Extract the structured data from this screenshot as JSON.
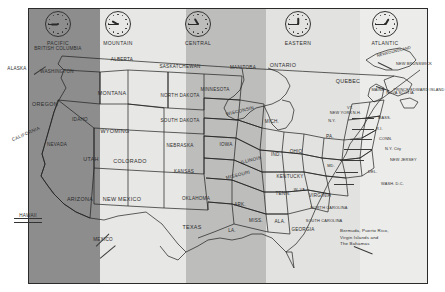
{
  "map": {
    "title": "North American Time Zones",
    "zones": [
      {
        "name": "PACIFIC",
        "clock_time": "9:00",
        "hour_deg": 270,
        "minute_deg": 270,
        "shade": "#8d8d8d"
      },
      {
        "name": "MOUNTAIN",
        "clock_time": "10:00",
        "hour_deg": 300,
        "minute_deg": 270,
        "shade": "#e7e7e5"
      },
      {
        "name": "CENTRAL",
        "clock_time": "11:00",
        "hour_deg": 330,
        "minute_deg": 270,
        "shade": "#bdbdbc"
      },
      {
        "name": "EASTERN",
        "clock_time": "12:00",
        "hour_deg": 0,
        "minute_deg": 270,
        "shade": "#e2e2e0"
      },
      {
        "name": "ATLANTIC",
        "clock_time": "1:00",
        "hour_deg": 30,
        "minute_deg": 270,
        "shade": "#ececea"
      }
    ],
    "canada": [
      {
        "label": "BRITISH COLUMBIA"
      },
      {
        "label": "ALBERTA"
      },
      {
        "label": "SASKATCHEWAN"
      },
      {
        "label": "MANITOBA"
      },
      {
        "label": "ONTARIO"
      },
      {
        "label": "QUEBEC"
      },
      {
        "label": "NEWFOUNDLAND"
      },
      {
        "label": "NEW BRUNSWICK"
      },
      {
        "label": "NOVA SCOTIA"
      },
      {
        "label": "PRINCE EDWARD ISLAND"
      }
    ],
    "states": [
      {
        "label": "WASHINGTON"
      },
      {
        "label": "OREGON"
      },
      {
        "label": "CALIFORNIA"
      },
      {
        "label": "NEVADA"
      },
      {
        "label": "IDAHO"
      },
      {
        "label": "MONTANA"
      },
      {
        "label": "WYOMING"
      },
      {
        "label": "UTAH"
      },
      {
        "label": "COLORADO"
      },
      {
        "label": "ARIZONA"
      },
      {
        "label": "NEW MEXICO"
      },
      {
        "label": "NORTH DAKOTA"
      },
      {
        "label": "SOUTH DAKOTA"
      },
      {
        "label": "NEBRASKA"
      },
      {
        "label": "KANSAS"
      },
      {
        "label": "OKLAHOMA"
      },
      {
        "label": "TEXAS"
      },
      {
        "label": "MINNESOTA"
      },
      {
        "label": "IOWA"
      },
      {
        "label": "MISSOURI"
      },
      {
        "label": "ARK."
      },
      {
        "label": "LA."
      },
      {
        "label": "WISCONSIN"
      },
      {
        "label": "ILLINOIS"
      },
      {
        "label": "MISS."
      },
      {
        "label": "ALA."
      },
      {
        "label": "MICH."
      },
      {
        "label": "IND."
      },
      {
        "label": "OHIO"
      },
      {
        "label": "KENTUCKY"
      },
      {
        "label": "TENN."
      },
      {
        "label": "GEORGIA"
      },
      {
        "label": "W. VA."
      },
      {
        "label": "VIRGINIA"
      },
      {
        "label": "NORTH CAROLINA"
      },
      {
        "label": "SOUTH CAROLINA"
      },
      {
        "label": "PA."
      },
      {
        "label": "N.Y."
      },
      {
        "label": "NEW YORK"
      },
      {
        "label": "VT."
      },
      {
        "label": "N.H."
      },
      {
        "label": "MAINE"
      },
      {
        "label": "MD."
      },
      {
        "label": "ALASKA"
      },
      {
        "label": "HAWAII"
      },
      {
        "label": "MEXICO"
      }
    ],
    "callouts": [
      {
        "label": "MASS."
      },
      {
        "label": "R.I."
      },
      {
        "label": "CONN."
      },
      {
        "label": "N.Y. City"
      },
      {
        "label": "NEW JERSEY"
      },
      {
        "label": "DEL."
      },
      {
        "label": "WASH.  D.C."
      }
    ],
    "note": {
      "line1": "Bermuda, Puerto Rico,",
      "line2": "Virgin Islands and",
      "line3": "The Bahamas"
    }
  }
}
